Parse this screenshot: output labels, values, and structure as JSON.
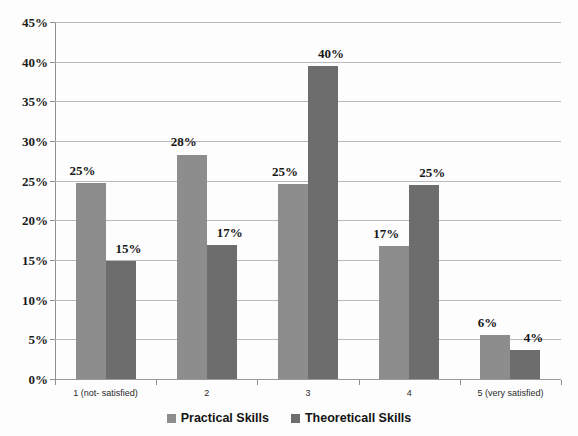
{
  "chart_data": {
    "type": "bar",
    "title": "",
    "xlabel": "",
    "ylabel": "",
    "ylim": [
      0,
      45
    ],
    "ytick_step": 5,
    "grid": true,
    "legend_position": "bottom",
    "categories": [
      "1 (not- satisfied)",
      "2",
      "3",
      "4",
      "5 (very satisfied)"
    ],
    "ytick_labels": [
      "45%",
      "40%",
      "35%",
      "30%",
      "25%",
      "20%",
      "15%",
      "10%",
      "5%",
      "0%"
    ],
    "ytick_values": [
      45,
      40,
      35,
      30,
      25,
      20,
      15,
      10,
      5,
      0
    ],
    "series": [
      {
        "name": "Practical Skills",
        "color": "#8d8d8d",
        "values": [
          25,
          28,
          25,
          17,
          6
        ],
        "plotted_values": [
          24.7,
          28.3,
          24.6,
          16.8,
          5.5
        ],
        "labels": [
          "25%",
          "28%",
          "25%",
          "17%",
          "6%"
        ]
      },
      {
        "name": "Theoreticall Skills",
        "color": "#6d6d6d",
        "values": [
          15,
          17,
          40,
          25,
          4
        ],
        "plotted_values": [
          14.9,
          16.9,
          39.4,
          24.5,
          3.6
        ],
        "labels": [
          "15%",
          "17%",
          "40%",
          "25%",
          "4%"
        ]
      }
    ]
  },
  "legend": {
    "items": [
      {
        "label": "Practical Skills",
        "color": "#8d8d8d"
      },
      {
        "label": "Theoreticall Skills",
        "color": "#6d6d6d"
      }
    ]
  },
  "artifacts": {
    "cropped_title_remnant": ""
  }
}
